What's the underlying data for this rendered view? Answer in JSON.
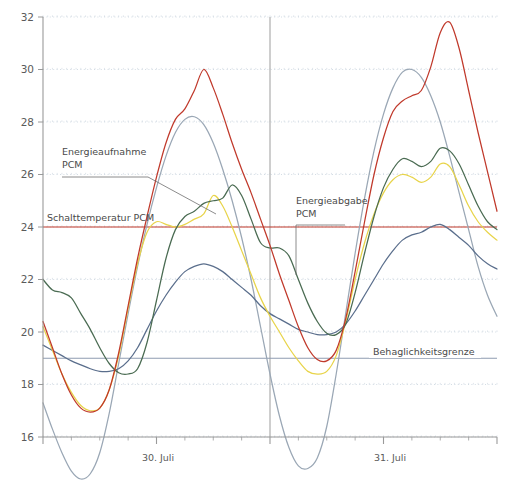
{
  "chart_data": {
    "type": "line",
    "title": "",
    "xlabel": "",
    "ylabel": "",
    "ylim": [
      16,
      32
    ],
    "ytick_values": [
      16,
      18,
      20,
      22,
      24,
      26,
      28,
      30,
      32
    ],
    "ytick_labels": [
      "16",
      "18",
      "20",
      "22",
      "24",
      "26",
      "28",
      "30",
      "32"
    ],
    "xlim": [
      0,
      48
    ],
    "xtick_labels": [
      "30. Juli",
      "31. Juli"
    ],
    "xtick_positions": [
      12,
      36
    ],
    "xtick_major": [
      0,
      12,
      24,
      36,
      48
    ],
    "xtick_minor": [
      3,
      6,
      9,
      15,
      18,
      21,
      27,
      30,
      33,
      39,
      42,
      45
    ],
    "grid": true,
    "grid_style": "dotted",
    "legend_position": "none",
    "day_divider_x": 24,
    "series": [
      {
        "name": "Aussenlufttemperatur",
        "color": "#c0392b",
        "x": [
          0,
          1,
          2,
          3,
          4,
          5,
          6,
          7,
          8,
          9,
          10,
          11,
          12,
          13,
          14,
          15,
          16,
          17,
          18,
          19,
          20,
          21,
          22,
          23,
          24,
          25,
          26,
          27,
          28,
          29,
          30,
          31,
          32,
          33,
          34,
          35,
          36,
          37,
          38,
          39,
          40,
          41,
          42,
          43,
          44,
          45,
          46,
          47,
          48
        ],
        "y": [
          20.4,
          19.4,
          18.4,
          17.6,
          17.1,
          16.95,
          17.1,
          17.8,
          19.2,
          21.0,
          22.8,
          24.4,
          25.9,
          27.2,
          28.1,
          28.5,
          29.2,
          30.0,
          29.3,
          28.3,
          27.2,
          26.2,
          25.3,
          24.3,
          23.3,
          22.2,
          21.2,
          20.2,
          19.4,
          18.95,
          18.9,
          19.3,
          20.5,
          22.3,
          24.2,
          26.0,
          27.4,
          28.4,
          28.8,
          29.0,
          29.2,
          30.1,
          31.4,
          31.8,
          30.8,
          29.2,
          27.6,
          26.1,
          24.6
        ]
      },
      {
        "name": "Raumtemperatur ohne PCM",
        "color": "#9aa7b5",
        "x": [
          0,
          1,
          2,
          3,
          4,
          5,
          6,
          7,
          8,
          9,
          10,
          11,
          12,
          13,
          14,
          15,
          16,
          17,
          18,
          19,
          20,
          21,
          22,
          23,
          24,
          25,
          26,
          27,
          28,
          29,
          30,
          31,
          32,
          33,
          34,
          35,
          36,
          37,
          38,
          39,
          40,
          41,
          42,
          43,
          44,
          45,
          46,
          47,
          48
        ],
        "y": [
          17.3,
          16.3,
          15.4,
          14.7,
          14.4,
          14.6,
          15.4,
          16.9,
          18.8,
          20.7,
          22.5,
          24.1,
          25.5,
          26.7,
          27.6,
          28.1,
          28.2,
          27.9,
          27.2,
          26.2,
          25.0,
          23.6,
          22.0,
          20.2,
          18.4,
          16.8,
          15.6,
          14.9,
          14.8,
          15.2,
          16.4,
          18.4,
          20.7,
          23.0,
          25.1,
          26.9,
          28.3,
          29.3,
          29.9,
          30.0,
          29.7,
          29.0,
          28.0,
          26.7,
          25.3,
          23.9,
          22.5,
          21.4,
          20.6
        ]
      },
      {
        "name": "Raumtemperatur mit PCM (Variante 1)",
        "color": "#4a6b52",
        "x": [
          0,
          1,
          2,
          3,
          4,
          5,
          6,
          7,
          8,
          9,
          10,
          11,
          12,
          13,
          14,
          15,
          16,
          17,
          18,
          19,
          20,
          21,
          22,
          23,
          24,
          25,
          26,
          27,
          28,
          29,
          30,
          31,
          32,
          33,
          34,
          35,
          36,
          37,
          38,
          39,
          40,
          41,
          42,
          43,
          44,
          45,
          46,
          47,
          48
        ],
        "y": [
          22.0,
          21.6,
          21.5,
          21.3,
          20.7,
          20.1,
          19.4,
          18.8,
          18.45,
          18.4,
          18.6,
          19.6,
          21.2,
          22.8,
          23.9,
          24.4,
          24.6,
          24.9,
          25.0,
          25.1,
          25.6,
          25.2,
          24.3,
          23.4,
          23.2,
          23.2,
          22.9,
          22.0,
          21.1,
          20.4,
          19.95,
          19.9,
          20.3,
          21.5,
          23.0,
          24.4,
          25.5,
          26.2,
          26.6,
          26.5,
          26.3,
          26.5,
          27.0,
          26.9,
          26.4,
          25.6,
          24.8,
          24.2,
          23.9
        ]
      },
      {
        "name": "Raumtemperatur mit PCM (Variante 2)",
        "color": "#e8d44a",
        "x": [
          0,
          1,
          2,
          3,
          4,
          5,
          6,
          7,
          8,
          9,
          10,
          11,
          12,
          13,
          14,
          15,
          16,
          17,
          18,
          19,
          20,
          21,
          22,
          23,
          24,
          25,
          26,
          27,
          28,
          29,
          30,
          31,
          32,
          33,
          34,
          35,
          36,
          37,
          38,
          39,
          40,
          41,
          42,
          43,
          44,
          45,
          46,
          47,
          48
        ],
        "y": [
          20.2,
          19.3,
          18.4,
          17.7,
          17.2,
          17.0,
          17.1,
          17.8,
          19.1,
          20.9,
          22.6,
          23.8,
          24.2,
          24.1,
          24.0,
          24.1,
          24.3,
          24.5,
          25.2,
          24.8,
          24.0,
          23.1,
          22.2,
          21.3,
          20.6,
          20.0,
          19.4,
          18.9,
          18.5,
          18.4,
          18.5,
          19.1,
          20.4,
          22.0,
          23.4,
          24.5,
          25.3,
          25.8,
          26.0,
          25.9,
          25.7,
          25.9,
          26.4,
          26.3,
          25.6,
          24.8,
          24.2,
          23.8,
          23.5
        ]
      },
      {
        "name": "Oberflaechentemperatur",
        "color": "#5a6e8c",
        "x": [
          0,
          1,
          2,
          3,
          4,
          5,
          6,
          7,
          8,
          9,
          10,
          11,
          12,
          13,
          14,
          15,
          16,
          17,
          18,
          19,
          20,
          21,
          22,
          23,
          24,
          25,
          26,
          27,
          28,
          29,
          30,
          31,
          32,
          33,
          34,
          35,
          36,
          37,
          38,
          39,
          40,
          41,
          42,
          43,
          44,
          45,
          46,
          47,
          48
        ],
        "y": [
          19.5,
          19.3,
          19.1,
          18.9,
          18.75,
          18.6,
          18.5,
          18.5,
          18.6,
          18.9,
          19.4,
          20.1,
          20.8,
          21.4,
          21.9,
          22.3,
          22.5,
          22.6,
          22.5,
          22.3,
          22.0,
          21.7,
          21.4,
          21.0,
          20.7,
          20.5,
          20.3,
          20.1,
          20.0,
          19.9,
          19.9,
          20.0,
          20.3,
          20.8,
          21.4,
          22.0,
          22.6,
          23.1,
          23.5,
          23.7,
          23.8,
          24.0,
          24.1,
          23.9,
          23.6,
          23.3,
          22.9,
          22.6,
          22.4
        ]
      }
    ],
    "hlines": [
      {
        "name": "Schalttemperatur PCM",
        "value": 24,
        "color": "#c0392b"
      },
      {
        "name": "Behaglichkeitsgrenze",
        "value": 19,
        "color": "#8e9bb0"
      }
    ],
    "annotations": [
      {
        "name": "Energieaufnahme PCM",
        "lines": [
          "Energieaufnahme",
          "PCM"
        ]
      },
      {
        "name": "Energieabgabe PCM",
        "lines": [
          "Energieabgabe",
          "PCM"
        ]
      },
      {
        "name": "Schalttemperatur PCM",
        "lines": [
          "Schalttemperatur PCM"
        ]
      },
      {
        "name": "Behaglichkeitsgrenze",
        "lines": [
          "Behaglichkeitsgrenze"
        ]
      }
    ]
  },
  "axis": {
    "y_labels": [
      "32",
      "30",
      "28",
      "26",
      "24",
      "22",
      "20",
      "18",
      "16"
    ],
    "x_labels": [
      "30. Juli",
      "31. Juli"
    ]
  },
  "labels": {
    "energieaufnahme_1": "Energieaufnahme",
    "energieaufnahme_2": "PCM",
    "energieabgabe_1": "Energieabgabe",
    "energieabgabe_2": "PCM",
    "schalttemperatur": "Schalttemperatur PCM",
    "behaglichkeitsgrenze": "Behaglichkeitsgrenze"
  },
  "colors": {
    "outside_air": "#c0392b",
    "no_pcm": "#9aa7b5",
    "pcm_v1": "#4a6b52",
    "pcm_v2": "#e8d44a",
    "surface": "#5a6e8c",
    "axis": "#9a9a9a",
    "grid": "#c9d4de",
    "switch_line": "#c0392b",
    "comfort_line": "#8e9bb0"
  }
}
